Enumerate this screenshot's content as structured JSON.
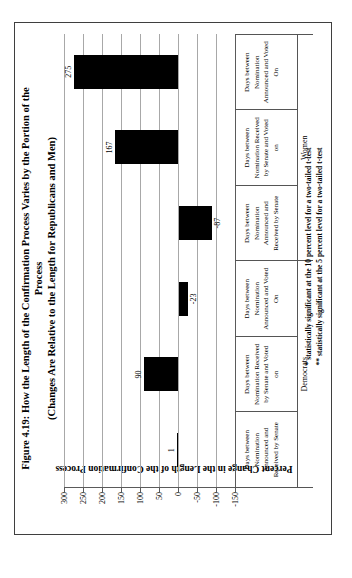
{
  "figure": {
    "title_line1": "Figure 4.19: How the Length of the Confirmation Process Varies by the Portion of the",
    "title_line2": "Process",
    "subtitle": "(Changes Are Relative to the Length for Republicans and Men)",
    "footnote_line1": "* statistically significant at the 10 percent level for a two-tailed t-test",
    "footnote_line2": "** statistically significant at the 5 percent level for a two-tailed t-test",
    "orientation_note_colors": {
      "bar": "#000000",
      "gridline": "#a8a8a8",
      "axis": "#5a5a5a",
      "border": "#3f3f3f",
      "background": "#ffffff"
    }
  },
  "chart_data": {
    "type": "bar",
    "title": "Figure 4.19: How the Length of the Confirmation Process Varies by the Portion of the Process (Changes Are Relative to the Length for Republicans and Men)",
    "xlabel": "",
    "ylabel": "Percent Change in the Length of the Confirmation Process",
    "ylim": [
      -150,
      300
    ],
    "yticks": [
      300,
      250,
      200,
      150,
      100,
      50,
      0,
      -50,
      -100,
      -150
    ],
    "grid": "on",
    "legend": "none",
    "bar_color": "#000000",
    "categories": [
      {
        "group": "Democrats",
        "lines": [
          "Days between",
          "Nomination",
          "Announced and",
          "Received by Senate"
        ]
      },
      {
        "group": "Democrats",
        "lines": [
          "Days between",
          "Nomination Received",
          "by Senate and Voted",
          "on"
        ]
      },
      {
        "group": "Democrats",
        "lines": [
          "Days between",
          "Nomination",
          "Announced and Voted",
          "On"
        ]
      },
      {
        "group": "Women",
        "lines": [
          "Days between",
          "Nomination",
          "Announced and",
          "Received by Senate"
        ]
      },
      {
        "group": "Women",
        "lines": [
          "Days between",
          "Nomination Received",
          "by Senate and Voted",
          "on"
        ]
      },
      {
        "group": "Women",
        "lines": [
          "Days between",
          "Nomination",
          "Announced and Voted",
          "On"
        ]
      }
    ],
    "groups": [
      {
        "label": "Democrats",
        "span": 3
      },
      {
        "label": "Women",
        "span": 3
      }
    ],
    "values": [
      1,
      90,
      -23,
      -87,
      167,
      275
    ],
    "value_labels": [
      "1",
      "90",
      "-23",
      "-87",
      "167",
      "275"
    ]
  }
}
